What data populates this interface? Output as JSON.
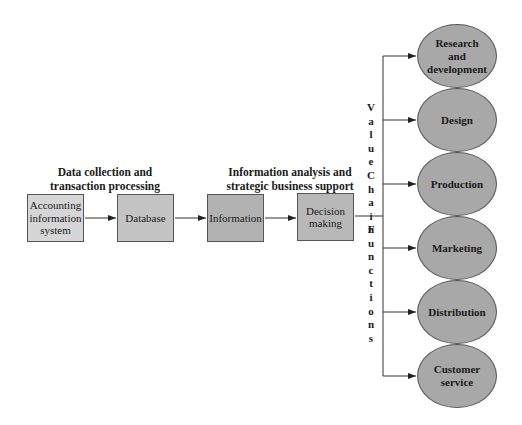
{
  "headings": {
    "left": [
      "Data collection and",
      "transaction processing"
    ],
    "right": [
      "Information analysis and",
      "strategic business support"
    ]
  },
  "process_boxes": [
    {
      "lines": [
        "Accounting",
        "information",
        "system"
      ],
      "fill": "#d6d6d6"
    },
    {
      "lines": [
        "Database"
      ],
      "fill": "#c4c4c4"
    },
    {
      "lines": [
        "Information"
      ],
      "fill": "#b2b2b2"
    },
    {
      "lines": [
        "Decision",
        "making"
      ],
      "fill": "#b8b8b8"
    }
  ],
  "vertical_label": {
    "words": [
      "Value",
      "Chain",
      "Functions"
    ]
  },
  "value_chain_functions": [
    {
      "lines": [
        "Research",
        "and",
        "development"
      ]
    },
    {
      "lines": [
        "Design"
      ]
    },
    {
      "lines": [
        "Production"
      ]
    },
    {
      "lines": [
        "Marketing"
      ]
    },
    {
      "lines": [
        "Distribution"
      ]
    },
    {
      "lines": [
        "Customer",
        "service"
      ]
    }
  ],
  "colors": {
    "ellipse_fill": "#a8a8a8",
    "line": "#333333"
  }
}
